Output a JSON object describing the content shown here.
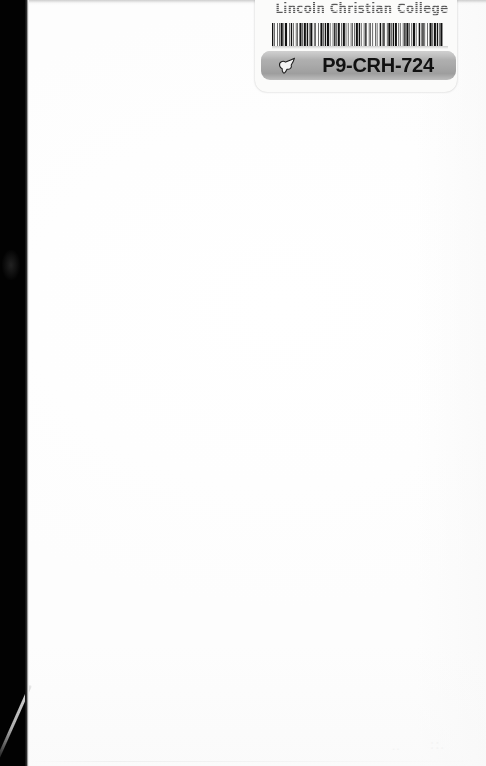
{
  "document": {
    "kind": "scanned-book-page",
    "page_state": "blank",
    "width": 486,
    "height": 766
  },
  "colors": {
    "page_background": "#ffffff",
    "scan_gutter": "#020202",
    "label_background": "#fbfbfa",
    "code_band": "#ababab",
    "code_text": "#111111",
    "institution_text": "#4c4c4c",
    "barcode_bars": "#101010"
  },
  "label": {
    "institution": "Lincoln Christian College",
    "code": "P9-CRH-724",
    "hand_icon_name": "pointing-hand-icon",
    "barcode": {
      "symbology": "Code 39",
      "encoded_value": "P9-CRH-724",
      "bar_widths": [
        2,
        1,
        1,
        3,
        1,
        2,
        1,
        1,
        3,
        1,
        1,
        1,
        3,
        3,
        1,
        1,
        2,
        1,
        1,
        3,
        1,
        1,
        1,
        2,
        3,
        1,
        1,
        1,
        3,
        1,
        2,
        1,
        1,
        1,
        3,
        2,
        1,
        1,
        1,
        3,
        1,
        2,
        3,
        1,
        1,
        1,
        2,
        1,
        3,
        1,
        1,
        3,
        1,
        1,
        2,
        1,
        1,
        1,
        3,
        2,
        1,
        1,
        3,
        1,
        1,
        2,
        1,
        3,
        1,
        1,
        1,
        2,
        1,
        1,
        3,
        1,
        2,
        1,
        1,
        3,
        1,
        1,
        2,
        3,
        1,
        1,
        1,
        2,
        1,
        3,
        1,
        1,
        1,
        3,
        2,
        1,
        1,
        1,
        2,
        3,
        1,
        1,
        3,
        1,
        1,
        1,
        2,
        1,
        3,
        2,
        1,
        1,
        1,
        3,
        1,
        1,
        2,
        1,
        3,
        1,
        1,
        2,
        1,
        1,
        3,
        1,
        1,
        3,
        2,
        1,
        1,
        1,
        2,
        1,
        1,
        3,
        1,
        2,
        3,
        1,
        1,
        1,
        3,
        1,
        2,
        1,
        1,
        1,
        3,
        2
      ]
    }
  },
  "artifacts": {
    "gutter_streak": "light-diagonal-streak",
    "gutter_smudge": "faint-smudge",
    "ghost_marks": [
      "..",
      "::."
    ]
  }
}
